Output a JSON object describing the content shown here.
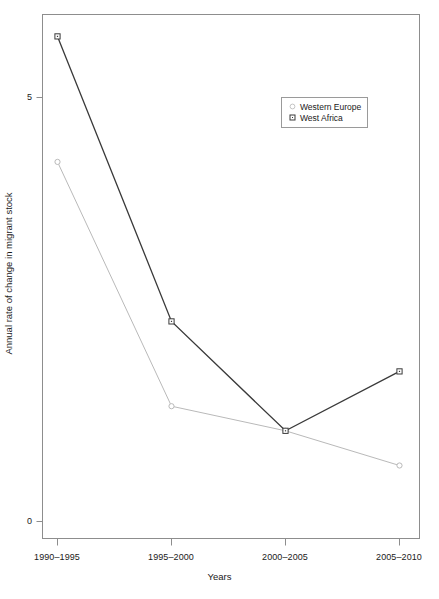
{
  "chart_data": {
    "type": "line",
    "title": "",
    "xlabel": "Years",
    "ylabel": "Annual rate of change in migrant stock",
    "categories": [
      "1990–1995",
      "1995–2000",
      "2000–2005",
      "2005–2010"
    ],
    "series": [
      {
        "name": "Western Europe",
        "values": [
          4.24,
          1.36,
          1.07,
          0.66
        ],
        "color": "#b9b9b9",
        "marker": "circle"
      },
      {
        "name": "West Africa",
        "values": [
          5.72,
          2.36,
          1.07,
          1.77
        ],
        "color": "#3a3a3a",
        "marker": "square"
      }
    ],
    "ylim": [
      0,
      6.2
    ],
    "y_ticks": [
      0,
      5
    ],
    "y_tick_labels": [
      "0",
      "5"
    ],
    "grid": false,
    "legend_position": "top-right",
    "box": true
  },
  "axes": {
    "x_title": "Years",
    "y_title": "Annual rate of change in migrant stock",
    "x_tick_labels": [
      "1990–1995",
      "1995–2000",
      "2000–2005",
      "2005–2010"
    ],
    "y_tick_labels": [
      "0",
      "5"
    ]
  },
  "legend": {
    "entries": [
      {
        "label": "Western Europe",
        "marker": "circle-marker",
        "color": "#b9b9b9"
      },
      {
        "label": "West Africa",
        "marker": "square-marker",
        "color": "#3a3a3a"
      }
    ]
  }
}
